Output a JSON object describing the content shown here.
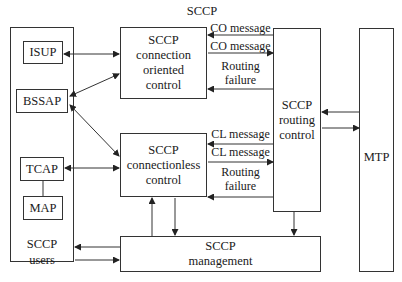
{
  "title": "SCCP",
  "users_panel": {
    "label_line1": "SCCP",
    "label_line2": "users"
  },
  "user_boxes": [
    {
      "id": "isup",
      "label": "ISUP"
    },
    {
      "id": "bssap",
      "label": "BSSAP"
    },
    {
      "id": "tcap",
      "label": "TCAP"
    },
    {
      "id": "map",
      "label": "MAP"
    }
  ],
  "co_control": {
    "line1": "SCCP",
    "line2": "connection",
    "line3": "oriented",
    "line4": "control"
  },
  "cl_control": {
    "line1": "SCCP",
    "line2": "connectionless",
    "line3": "control"
  },
  "routing": {
    "line1": "SCCP",
    "line2": "routing",
    "line3": "control"
  },
  "management": {
    "line1": "SCCP",
    "line2": "management"
  },
  "mtp": {
    "label": "MTP"
  },
  "co_messages": {
    "msg_in": "CO message",
    "msg_out": "CO message",
    "fail_line1": "Routing",
    "fail_line2": "failure"
  },
  "cl_messages": {
    "msg_in": "CL message",
    "msg_out": "CL message",
    "fail_line1": "Routing",
    "fail_line2": "failure"
  }
}
